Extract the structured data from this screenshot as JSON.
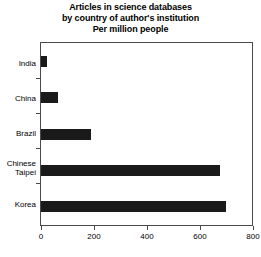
{
  "chart_data": {
    "type": "bar",
    "orientation": "horizontal",
    "title": "Articles in science databases by country of author's institution Per million people",
    "title_lines": [
      "Articles in science databases",
      "by country of author's institution",
      "Per million people"
    ],
    "categories": [
      "India",
      "China",
      "Brazil",
      "Chinese Taipei",
      "Korea"
    ],
    "category_label_lines": [
      [
        "India"
      ],
      [
        "China"
      ],
      [
        "Brazil"
      ],
      [
        "Chinese",
        "Taipei"
      ],
      [
        "Korea"
      ]
    ],
    "values": [
      23,
      65,
      187,
      676,
      699
    ],
    "xlabel": "",
    "ylabel": "",
    "xlim": [
      0,
      800
    ],
    "ylim": null,
    "xticks": [
      0,
      200,
      400,
      600,
      800
    ],
    "xtick_labels": [
      "0",
      "200",
      "400",
      "600",
      "800"
    ],
    "grid": false,
    "legend": false,
    "legend_position": "none",
    "bar_color": "#1a1a1a",
    "frame_color": "#4a4a4a",
    "background_color": "#ffffff"
  }
}
